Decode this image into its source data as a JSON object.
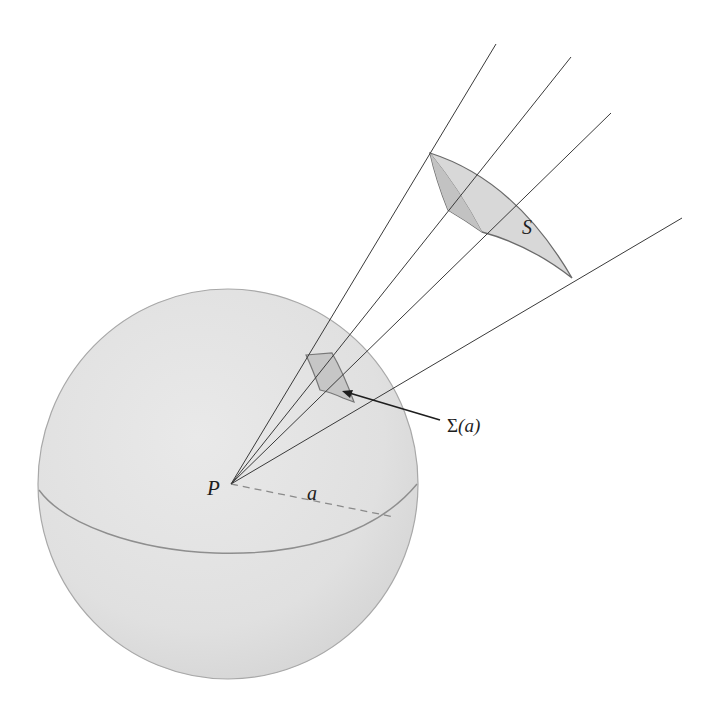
{
  "figure": {
    "type": "geometry-diagram",
    "colors": {
      "background": "#ffffff",
      "sphere_fill": "#e2e2e2",
      "sphere_edge": "#9a9a9a",
      "ray": "#3a3a3a",
      "surface_fill": "#d6d6d6",
      "surface_edge": "#6a6a6a",
      "patch_fill": "#c4c4c4",
      "radius_dash": "#8a8a8a"
    }
  },
  "labels": {
    "center": "P",
    "radius": "a",
    "surface": "S",
    "patch_sigma": "Σ",
    "patch_arg": "(a)"
  }
}
